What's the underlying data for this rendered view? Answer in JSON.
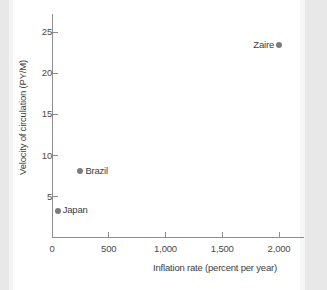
{
  "chart_data": {
    "type": "scatter",
    "title": "",
    "xlabel": "Inflation rate (percent per year)",
    "ylabel": "Velocity of circulation (PY/M)",
    "xlim": [
      0,
      2200
    ],
    "ylim": [
      0,
      27
    ],
    "grid": false,
    "legend": "none",
    "xticks": [
      "0",
      "500",
      "1,000",
      "1,500",
      "2,000"
    ],
    "xtick_values": [
      0,
      500,
      1000,
      1500,
      2000
    ],
    "yticks": [
      "5",
      "10",
      "15",
      "20",
      "25"
    ],
    "ytick_values": [
      5,
      10,
      15,
      20,
      25
    ],
    "marker_color": "#7c7c7c",
    "axis_color": "#8e8e8e",
    "points": [
      {
        "label": "Japan",
        "x": 50,
        "y": 3.3,
        "label_side": "right"
      },
      {
        "label": "Brazil",
        "x": 250,
        "y": 8.1,
        "label_side": "right"
      },
      {
        "label": "Zaire",
        "x": 2000,
        "y": 23.4,
        "label_side": "left"
      }
    ]
  }
}
